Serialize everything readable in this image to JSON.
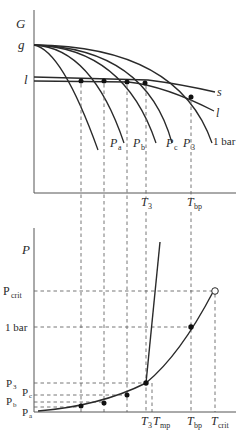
{
  "top_panel": {
    "y_axis_label": "G",
    "g_label": "g",
    "l_label": "l",
    "curve_labels": {
      "s": "s",
      "l": "l",
      "one_bar": "1 bar",
      "Pa": "P",
      "Pa_sub": "a",
      "Pb": "P",
      "Pb_sub": "b",
      "Pc": "P",
      "Pc_sub": "c",
      "P3": "P",
      "P3_sub": "3"
    },
    "x_ticks": {
      "T3": "T",
      "T3_sub": "3",
      "Tbp": "T",
      "Tbp_sub": "bp"
    }
  },
  "bottom_panel": {
    "y_axis_label": "P",
    "y_ticks": {
      "Pcrit": "P",
      "Pcrit_sub": "crit",
      "one_bar": "1 bar",
      "P3": "P",
      "P3_sub": "3",
      "Pc": "P",
      "Pc_sub": "c",
      "Pb": "P",
      "Pb_sub": "b",
      "Pa": "P",
      "Pa_sub": "a"
    },
    "x_ticks": {
      "T3": "T",
      "T3_sub": "3",
      "Tmp": "T",
      "Tmp_sub": "mp",
      "Tbp": "T",
      "Tbp_sub": "bp",
      "Tcrit": "T",
      "Tcrit_sub": "crit"
    }
  },
  "colors": {
    "line": "#2a2a2a",
    "axis": "#555555",
    "dashed": "#666666"
  }
}
